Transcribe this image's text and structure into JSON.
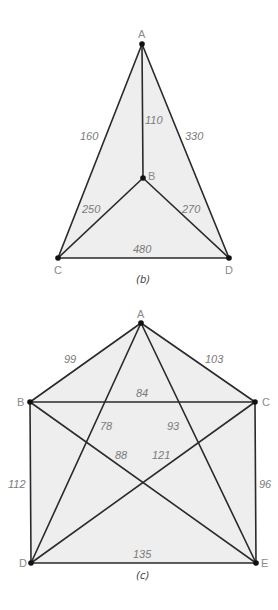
{
  "figures": [
    {
      "id": "b",
      "caption": "(b)",
      "vertices": [
        {
          "name": "A",
          "x": 142,
          "y": 44
        },
        {
          "name": "B",
          "x": 143,
          "y": 178
        },
        {
          "name": "C",
          "x": 58,
          "y": 258
        },
        {
          "name": "D",
          "x": 229,
          "y": 258
        }
      ],
      "edges": [
        {
          "from": "A",
          "to": "C",
          "weight": "160"
        },
        {
          "from": "A",
          "to": "B",
          "weight": "110"
        },
        {
          "from": "A",
          "to": "D",
          "weight": "330"
        },
        {
          "from": "B",
          "to": "C",
          "weight": "250"
        },
        {
          "from": "B",
          "to": "D",
          "weight": "270"
        },
        {
          "from": "C",
          "to": "D",
          "weight": "480"
        }
      ]
    },
    {
      "id": "c",
      "caption": "(c)",
      "vertices": [
        {
          "name": "A",
          "x": 141,
          "y": 323
        },
        {
          "name": "B",
          "x": 30,
          "y": 402
        },
        {
          "name": "C",
          "x": 255,
          "y": 402
        },
        {
          "name": "D",
          "x": 31,
          "y": 563
        },
        {
          "name": "E",
          "x": 256,
          "y": 563
        }
      ],
      "edges": [
        {
          "from": "A",
          "to": "B",
          "weight": "99"
        },
        {
          "from": "A",
          "to": "C",
          "weight": "103"
        },
        {
          "from": "B",
          "to": "C",
          "weight": "84"
        },
        {
          "from": "A",
          "to": "D",
          "weight": "78"
        },
        {
          "from": "A",
          "to": "E",
          "weight": "93"
        },
        {
          "from": "B",
          "to": "E",
          "weight": "88"
        },
        {
          "from": "C",
          "to": "D",
          "weight": "121"
        },
        {
          "from": "B",
          "to": "D",
          "weight": "112"
        },
        {
          "from": "C",
          "to": "E",
          "weight": "96"
        },
        {
          "from": "D",
          "to": "E",
          "weight": "135"
        }
      ]
    }
  ]
}
